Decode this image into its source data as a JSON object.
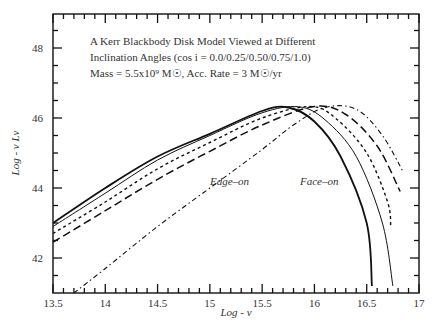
{
  "chart_data": {
    "type": "line",
    "title": "A Kerr Blackbody Disk Model Viewed at Different",
    "subtitle_lines": [
      "A Kerr Blackbody Disk Model Viewed at Different",
      "Inclination Angles (cos i = 0.0/0.25/0.50/0.75/1.0)",
      "Mass = 5.5x10⁹ M☉, Acc. Rate = 3 M☉/yr"
    ],
    "xlabel": "Log - ν",
    "ylabel": "Log - ν Lν",
    "xlim": [
      13.5,
      17
    ],
    "ylim": [
      41.0,
      49.0
    ],
    "x_ticks": [
      "13.5",
      "14",
      "14.5",
      "15",
      "15.5",
      "16",
      "16.5",
      "17"
    ],
    "x_tick_values": [
      13.5,
      14,
      14.5,
      15,
      15.5,
      16,
      16.5,
      17
    ],
    "y_ticks": [
      "42",
      "44",
      "46",
      "48"
    ],
    "y_tick_values": [
      42,
      44,
      46,
      48
    ],
    "grid": false,
    "legend": "none",
    "annotations": [
      {
        "text": "Edge–on",
        "x": 15.3,
        "y": 43.6
      },
      {
        "text": "Face–on",
        "x": 15.95,
        "y": 43.6
      }
    ],
    "series": [
      {
        "name": "cos i = 1.0 (Face-on)",
        "style": "solid-thick",
        "x": [
          13.5,
          14.0,
          14.5,
          15.0,
          15.5,
          15.75,
          16.0,
          16.25,
          16.5,
          16.55
        ],
        "y": [
          43.0,
          44.0,
          44.9,
          45.55,
          46.2,
          46.3,
          45.9,
          44.9,
          43.0,
          41.2
        ]
      },
      {
        "name": "cos i = 0.75",
        "style": "solid-thin",
        "x": [
          13.5,
          14.0,
          14.5,
          15.0,
          15.5,
          15.85,
          16.1,
          16.4,
          16.65,
          16.75
        ],
        "y": [
          42.9,
          43.85,
          44.8,
          45.5,
          46.15,
          46.32,
          45.95,
          44.9,
          43.0,
          41.2
        ]
      },
      {
        "name": "cos i = 0.50",
        "style": "short-dash",
        "x": [
          13.5,
          14.0,
          14.5,
          15.0,
          15.5,
          15.95,
          16.2,
          16.5,
          16.7,
          16.73
        ],
        "y": [
          42.7,
          43.6,
          44.55,
          45.3,
          46.0,
          46.33,
          46.0,
          45.0,
          43.6,
          42.9
        ]
      },
      {
        "name": "cos i = 0.25",
        "style": "long-dash",
        "x": [
          13.5,
          14.0,
          14.5,
          15.0,
          15.5,
          16.0,
          16.3,
          16.6,
          16.82
        ],
        "y": [
          42.45,
          43.35,
          44.25,
          45.05,
          45.8,
          46.33,
          46.1,
          45.2,
          43.9
        ]
      },
      {
        "name": "cos i = 0.0 (Edge-on)",
        "style": "dash-dot",
        "x": [
          13.7,
          14.0,
          14.5,
          15.0,
          15.5,
          15.8,
          16.1,
          16.4,
          16.65,
          16.85
        ],
        "y": [
          41.0,
          41.7,
          42.9,
          44.0,
          45.1,
          45.8,
          46.3,
          46.25,
          45.5,
          44.45
        ]
      }
    ]
  }
}
